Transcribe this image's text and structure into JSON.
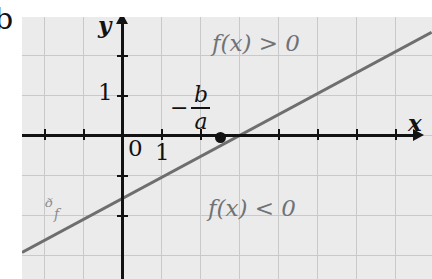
{
  "figure": {
    "type": "math-graph",
    "edge_glyph": "b",
    "background": "#ebebeb",
    "line_color": "#6e6e6e",
    "axis_color": "#121212",
    "grid_color": "#c9c9c9",
    "annotation_color": "#6f7276"
  },
  "axes": {
    "x_label": "x",
    "y_label": "y",
    "origin_label": "0",
    "x_unit_label": "1",
    "y_unit_label": "1"
  },
  "annotations": {
    "root_label_sign": "−",
    "root_label_numerator": "b",
    "root_label_denominator": "a",
    "positive_region": "f(x) > 0",
    "negative_region": "f(x) < 0",
    "curve_name": "ᶞ",
    "curve_subscript": "f"
  },
  "chart_data": {
    "type": "line",
    "title": "",
    "xlabel": "x",
    "ylabel": "y",
    "xlim": [
      -2.55,
      7.9
    ],
    "ylim": [
      -3.55,
      3.0
    ],
    "grid": true,
    "legend": "none",
    "series": [
      {
        "name": "f",
        "x": [
          -2.55,
          7.9
        ],
        "y": [
          -2.88,
          2.63
        ],
        "slope": 0.527,
        "x_intercept": 2.5,
        "y_intercept": -1.32
      }
    ],
    "points": [
      {
        "label": "-b/a",
        "x": 2.5,
        "y": 0
      }
    ],
    "xticks": [
      1
    ],
    "yticks": [
      1
    ],
    "annotations": [
      {
        "text": "f(x) > 0",
        "x": 4.3,
        "y": 2.25
      },
      {
        "text": "f(x) < 0",
        "x": 4.2,
        "y": -1.85
      },
      {
        "text": "Cf",
        "x": -1.05,
        "y": -2.1
      }
    ]
  }
}
